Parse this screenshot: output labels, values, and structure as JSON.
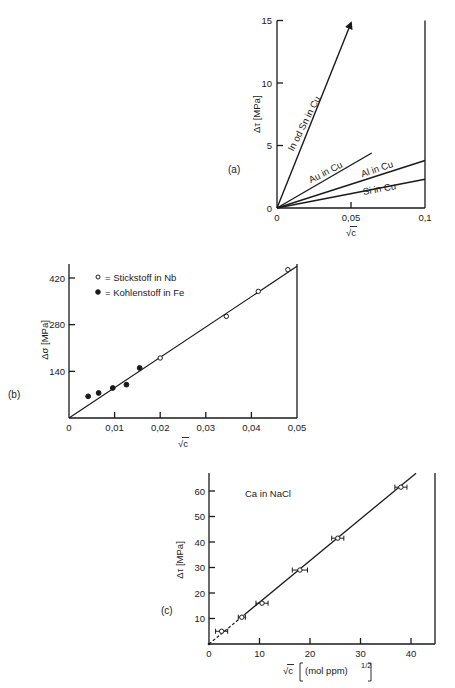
{
  "colors": {
    "ink": "#1a1a1a",
    "background": "#ffffff"
  },
  "chart_data": [
    {
      "panel": "(a)",
      "type": "line",
      "xlabel": "√c",
      "ylabel": "Δτ [MPa]",
      "xlim": [
        0,
        0.1
      ],
      "ylim": [
        0,
        15
      ],
      "xticks": [
        "0",
        "0,05",
        "0,1"
      ],
      "yticks": [
        "0",
        "5",
        "10",
        "15"
      ],
      "series": [
        {
          "name": "In od Sn in Cu",
          "x": [
            0,
            0.05
          ],
          "y": [
            0,
            14.8
          ],
          "arrow": true
        },
        {
          "name": "Au in Cu",
          "x": [
            0,
            0.064
          ],
          "y": [
            0,
            4.4
          ]
        },
        {
          "name": "Al in Cu",
          "x": [
            0,
            0.1
          ],
          "y": [
            0,
            3.8
          ]
        },
        {
          "name": "Si in Cu",
          "x": [
            0,
            0.1
          ],
          "y": [
            0,
            2.3
          ]
        }
      ]
    },
    {
      "panel": "(b)",
      "type": "scatter",
      "xlabel": "√c",
      "ylabel": "Δσ [MPa]",
      "xlim": [
        0,
        0.05
      ],
      "ylim": [
        0,
        470
      ],
      "xticks": [
        "0",
        "0,01",
        "0,02",
        "0,03",
        "0,04",
        "0,05"
      ],
      "yticks": [
        "140",
        "280",
        "420"
      ],
      "legend": [
        {
          "marker": "open-circle",
          "label": "= Stickstoff in Nb"
        },
        {
          "marker": "filled-circle",
          "label": "= Kohlenstoff in Fe"
        }
      ],
      "series": [
        {
          "name": "Stickstoff in Nb",
          "marker": "open",
          "x": [
            0.02,
            0.0345,
            0.0415,
            0.048
          ],
          "y": [
            180,
            305,
            380,
            445
          ]
        },
        {
          "name": "Kohlenstoff in Fe",
          "marker": "filled",
          "x": [
            0.0042,
            0.0065,
            0.0096,
            0.0126,
            0.0155
          ],
          "y": [
            65,
            75,
            90,
            100,
            150
          ]
        }
      ],
      "fit_line": {
        "x": [
          0,
          0.05
        ],
        "y": [
          0,
          455
        ]
      }
    },
    {
      "panel": "(c)",
      "type": "scatter",
      "title": "Ca in NaCl",
      "xlabel": "√c",
      "xlabel_unit": "(mol ppm)",
      "xlabel_exp": "1/2",
      "ylabel": "Δτ [MPa]",
      "xlim": [
        0,
        45
      ],
      "ylim": [
        0,
        67
      ],
      "xticks": [
        "0",
        "10",
        "20",
        "30",
        "40"
      ],
      "yticks": [
        "10",
        "20",
        "30",
        "40",
        "50",
        "60"
      ],
      "series": [
        {
          "name": "Ca in NaCl",
          "marker": "open-with-xerr",
          "x": [
            2.5,
            6.5,
            10.5,
            18,
            25.5,
            38
          ],
          "y": [
            5,
            10.5,
            16,
            29,
            41.5,
            61.5
          ],
          "xerr": [
            1.2,
            0.7,
            1.2,
            1.5,
            1.2,
            1.2
          ]
        }
      ],
      "fit_line": {
        "x": [
          0,
          41
        ],
        "y": [
          0,
          67
        ],
        "dashed_until_x": 7
      }
    }
  ]
}
